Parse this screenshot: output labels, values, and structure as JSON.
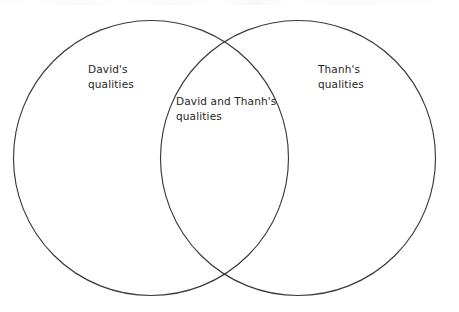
{
  "document": {
    "type": "venn-diagram",
    "title": "Two-circle Venn diagram comparing David's and Thanh's qualities",
    "background_color": "#ffffff",
    "stroke_color": "#3a3a3a",
    "text_color": "#262626"
  },
  "diagram": {
    "circles": [
      {
        "id": "left",
        "name": "David",
        "cx": 151,
        "cy": 158,
        "r": 137.5
      },
      {
        "id": "right",
        "name": "Thanh",
        "cx": 298,
        "cy": 158,
        "r": 137.5
      }
    ],
    "labels": {
      "left": "David's\nqualities",
      "center": "David and Thanh's\nqualities",
      "right": "Thanh's\nqualities"
    }
  }
}
